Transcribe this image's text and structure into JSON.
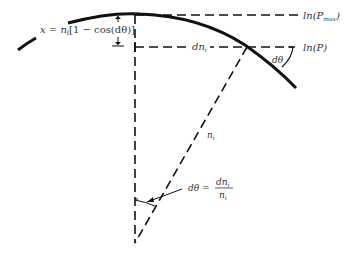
{
  "diagram": {
    "labels": {
      "x_formula_prefix": "x = n",
      "x_formula_sub": "i",
      "x_formula_suffix": "[1 − cos(dθ)]",
      "ln_pmax_prefix": "ln(P",
      "ln_pmax_sub": "max",
      "ln_pmax_suffix": ")",
      "ln_p": "ln(P)",
      "dn_i": "dn",
      "dn_i_sub": "i",
      "dtheta_angle": "dθ",
      "n_i": "n",
      "n_i_sub": "i",
      "dtheta_eq_lhs": "dθ =",
      "dtheta_eq_num": "dn",
      "dtheta_eq_num_sub": "i",
      "dtheta_eq_den": "n",
      "dtheta_eq_den_sub": "i"
    },
    "colors": {
      "stroke": "#111111",
      "text": "#333333"
    }
  }
}
